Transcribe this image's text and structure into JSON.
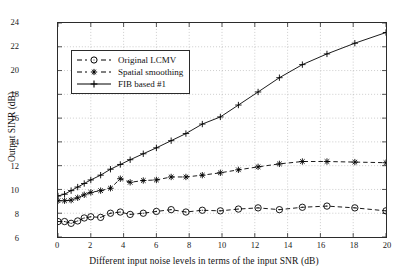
{
  "chart_data": {
    "type": "line",
    "title": "",
    "xlabel": "Different input noise levels in terms of the input SNR (dB)",
    "ylabel": "Output SINR (dB)",
    "xlim": [
      0,
      20
    ],
    "ylim": [
      6,
      24
    ],
    "xticks": [
      0,
      2,
      4,
      6,
      8,
      10,
      12,
      14,
      16,
      18,
      20
    ],
    "yticks": [
      6,
      8,
      10,
      12,
      14,
      16,
      18,
      20,
      22,
      24
    ],
    "grid": true,
    "grid_style": "dotted",
    "legend_position": "upper left",
    "series": [
      {
        "name": "Original LCMV",
        "marker": "circle",
        "linestyle": "dashed",
        "color": "#000000",
        "x": [
          0.0,
          0.4,
          0.8,
          1.2,
          1.6,
          2.0,
          2.6,
          3.2,
          3.8,
          4.4,
          5.2,
          6.0,
          6.9,
          7.8,
          8.8,
          9.9,
          11.0,
          12.2,
          13.5,
          14.9,
          16.4,
          18.1,
          20.0
        ],
        "y": [
          7.3,
          7.3,
          7.15,
          7.35,
          7.6,
          7.7,
          7.65,
          8.0,
          8.1,
          7.9,
          8.0,
          8.15,
          8.3,
          8.1,
          8.25,
          8.2,
          8.35,
          8.45,
          8.3,
          8.5,
          8.6,
          8.45,
          8.2
        ]
      },
      {
        "name": "Spatial smoothing",
        "marker": "asterisk",
        "linestyle": "dashed",
        "color": "#000000",
        "x": [
          0.0,
          0.4,
          0.8,
          1.2,
          1.6,
          2.0,
          2.6,
          3.2,
          3.8,
          4.4,
          5.2,
          6.0,
          6.9,
          7.8,
          8.8,
          9.9,
          11.0,
          12.2,
          13.5,
          14.9,
          16.4,
          18.1,
          20.0
        ],
        "y": [
          9.05,
          9.05,
          9.1,
          9.3,
          9.55,
          9.75,
          9.9,
          10.1,
          10.9,
          10.6,
          10.75,
          10.8,
          11.05,
          11.05,
          11.2,
          11.4,
          11.65,
          11.9,
          12.15,
          12.35,
          12.35,
          12.3,
          12.25
        ]
      },
      {
        "name": "FIB based #1",
        "marker": "plus",
        "linestyle": "solid",
        "color": "#000000",
        "x": [
          0.0,
          0.4,
          0.8,
          1.2,
          1.6,
          2.0,
          2.6,
          3.2,
          3.8,
          4.4,
          5.2,
          6.0,
          6.9,
          7.8,
          8.8,
          9.9,
          11.0,
          12.2,
          13.5,
          14.9,
          16.4,
          18.1,
          20.0
        ],
        "y": [
          9.45,
          9.6,
          9.9,
          10.2,
          10.5,
          10.8,
          11.2,
          11.7,
          12.1,
          12.5,
          13.0,
          13.5,
          14.1,
          14.7,
          15.5,
          16.1,
          17.1,
          18.2,
          19.4,
          20.5,
          21.4,
          22.3,
          23.2
        ]
      }
    ]
  },
  "legend": {
    "items": [
      {
        "label": "Original LCMV"
      },
      {
        "label": "Spatial smoothing"
      },
      {
        "label": "FIB based #1"
      }
    ]
  }
}
